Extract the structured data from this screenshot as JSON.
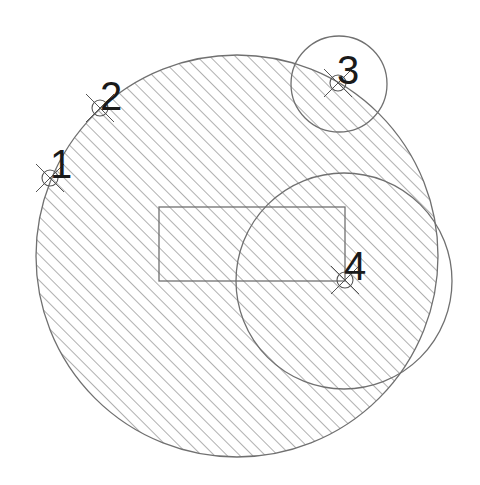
{
  "diagram": {
    "type": "cad-hatched-circles",
    "colors": {
      "line": "#707070",
      "hatch": "#6e6e6e",
      "text": "#1a1a1a",
      "background": "#ffffff"
    },
    "main_circle": {
      "cx": 237,
      "cy": 256,
      "r": 201,
      "hatched": true
    },
    "circles": [
      {
        "id": "circle-3",
        "cx": 339,
        "cy": 84,
        "r": 48
      },
      {
        "id": "circle-4",
        "cx": 344,
        "cy": 281,
        "r": 108
      }
    ],
    "rectangle": {
      "x": 159,
      "y": 207,
      "w": 186,
      "h": 74
    },
    "points": [
      {
        "label": "1",
        "x": 50,
        "y": 178,
        "lx": 50,
        "ly": 178
      },
      {
        "label": "2",
        "x": 100,
        "y": 108,
        "lx": 100,
        "ly": 110
      },
      {
        "label": "3",
        "x": 338,
        "y": 83,
        "lx": 337,
        "ly": 84
      },
      {
        "label": "4",
        "x": 345,
        "y": 280,
        "lx": 344,
        "ly": 280
      }
    ]
  }
}
